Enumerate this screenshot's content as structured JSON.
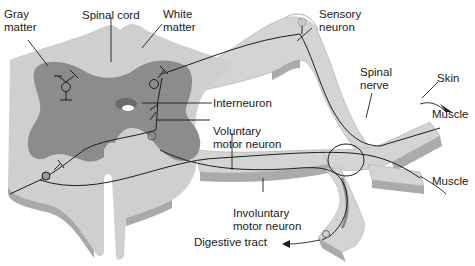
{
  "diagram": {
    "colors": {
      "white_matter": "#cfcfcf",
      "white_matter_side": "#a9a9a9",
      "gray_matter": "#8c8c8c",
      "nerve_fill": "#d4d4d4",
      "nerve_side": "#ababab",
      "line": "#1e1e1e",
      "background": "#ffffff"
    },
    "labels": {
      "gray_matter_1": "Gray",
      "gray_matter_2": "matter",
      "spinal_cord": "Spinal cord",
      "white_matter_1": "White",
      "white_matter_2": "matter",
      "sensory_neuron_1": "Sensory",
      "sensory_neuron_2": "neuron",
      "interneuron": "Interneuron",
      "spinal_nerve_1": "Spinal",
      "spinal_nerve_2": "nerve",
      "skin": "Skin",
      "muscle_upper": "Muscle",
      "muscle_lower": "Muscle",
      "voluntary_motor_1": "Voluntary",
      "voluntary_motor_2": "motor neuron",
      "involuntary_motor_1": "Involuntary",
      "involuntary_motor_2": "motor neuron",
      "digestive_tract": "Digestive tract"
    }
  }
}
